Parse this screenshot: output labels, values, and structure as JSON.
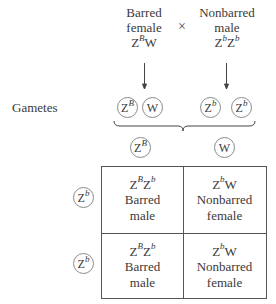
{
  "cross": {
    "female_parent": {
      "phenotype": "Barred",
      "sex": "female",
      "genotype_base1": "Z",
      "genotype_sup1": "B",
      "genotype_rest": "W"
    },
    "symbol": "×",
    "male_parent": {
      "phenotype": "Nonbarred",
      "sex": "male",
      "genotype_base1": "Z",
      "genotype_sup1": "b",
      "genotype_base2": "Z",
      "genotype_sup2": "b"
    }
  },
  "gametes_label": "Gametes",
  "gametes": [
    {
      "base": "Z",
      "sup": "B"
    },
    {
      "base": "W",
      "sup": ""
    },
    {
      "base": "Z",
      "sup": "b"
    },
    {
      "base": "Z",
      "sup": "b"
    }
  ],
  "punnett": {
    "column_headers": [
      {
        "base": "Z",
        "sup": "B"
      },
      {
        "base": "W",
        "sup": ""
      }
    ],
    "row_headers": [
      {
        "base": "Z",
        "sup": "b"
      },
      {
        "base": "Z",
        "sup": "b"
      }
    ],
    "cells": [
      [
        {
          "g1": "Z",
          "s1": "B",
          "g2": "Z",
          "s2": "b",
          "phenotype": "Barred",
          "sex": "male"
        },
        {
          "g1": "Z",
          "s1": "b",
          "g2": "W",
          "s2": "",
          "phenotype": "Nonbarred",
          "sex": "female"
        }
      ],
      [
        {
          "g1": "Z",
          "s1": "B",
          "g2": "Z",
          "s2": "b",
          "phenotype": "Barred",
          "sex": "male"
        },
        {
          "g1": "Z",
          "s1": "b",
          "g2": "W",
          "s2": "",
          "phenotype": "Nonbarred",
          "sex": "female"
        }
      ]
    ]
  }
}
